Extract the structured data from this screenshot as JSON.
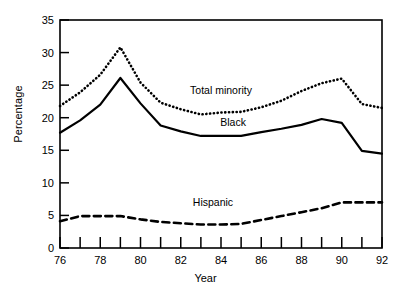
{
  "chart_data": {
    "type": "line",
    "title": "",
    "xlabel": "Year",
    "ylabel": "Percentage",
    "xlim": [
      76,
      92
    ],
    "ylim": [
      0,
      35
    ],
    "grid": false,
    "legend_position": "inline-annotations",
    "x": [
      76,
      77,
      78,
      79,
      80,
      81,
      82,
      83,
      84,
      85,
      86,
      87,
      88,
      89,
      90,
      91,
      92
    ],
    "xticks": [
      76,
      77,
      78,
      79,
      80,
      81,
      82,
      83,
      84,
      85,
      86,
      87,
      88,
      89,
      90,
      91,
      92
    ],
    "xtick_labels": [
      "76",
      "",
      "78",
      "",
      "80",
      "",
      "82",
      "",
      "84",
      "",
      "86",
      "",
      "88",
      "",
      "90",
      "",
      "92"
    ],
    "yticks": [
      0,
      5,
      10,
      15,
      20,
      25,
      30,
      35
    ],
    "ytick_labels": [
      "0",
      "5",
      "10",
      "15",
      "20",
      "25",
      "30",
      "35"
    ],
    "series": [
      {
        "name": "Total minority",
        "style": "dotted",
        "color": "#000000",
        "label_x": 84.0,
        "label_y": 23.6,
        "values": [
          21.8,
          23.9,
          26.6,
          30.8,
          25.4,
          22.3,
          21.3,
          20.5,
          20.8,
          20.9,
          21.6,
          22.6,
          24.1,
          25.3,
          26.0,
          22.1,
          21.5
        ]
      },
      {
        "name": "Black",
        "style": "solid",
        "color": "#000000",
        "label_x": 84.6,
        "label_y": 18.8,
        "values": [
          17.7,
          19.6,
          22.0,
          26.1,
          22.2,
          18.8,
          17.9,
          17.2,
          17.2,
          17.2,
          17.8,
          18.3,
          18.9,
          19.8,
          19.2,
          14.9,
          14.5
        ]
      },
      {
        "name": "Hispanic",
        "style": "dashed",
        "color": "#000000",
        "label_x": 83.6,
        "label_y": 6.5,
        "values": [
          4.1,
          4.9,
          4.9,
          4.9,
          4.4,
          4.0,
          3.8,
          3.6,
          3.6,
          3.7,
          4.3,
          4.9,
          5.5,
          6.1,
          7.0,
          7.0,
          7.0
        ]
      }
    ]
  },
  "axis": {
    "y_title": "Percentage",
    "x_title": "Year"
  },
  "annotations": {
    "total_minority": "Total minority",
    "black": "Black",
    "hispanic": "Hispanic"
  }
}
